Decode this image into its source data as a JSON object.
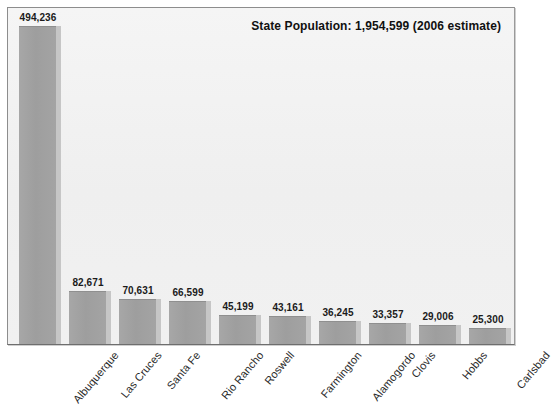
{
  "chart_data": {
    "type": "bar",
    "title": "State Population: 1,954,599 (2006 estimate)",
    "xlabel": "",
    "ylabel": "",
    "ylim": [
      0,
      494236
    ],
    "grid": false,
    "legend": null,
    "categories": [
      "Albuquerque",
      "Las Cruces",
      "Santa Fe",
      "Rio Rancho",
      "Roswell",
      "Farmington",
      "Alamogordo",
      "Clovis",
      "Hobbs",
      "Carlsbad"
    ],
    "values": [
      494236,
      82671,
      70631,
      66599,
      45199,
      43161,
      36245,
      33357,
      29006,
      25300
    ],
    "value_labels": [
      "494,236",
      "82,671",
      "70,631",
      "66,599",
      "45,199",
      "43,161",
      "36,245",
      "33,357",
      "29,006",
      "25,300"
    ],
    "colors": {
      "bar_fill": "#9e9e9e",
      "bar_shadow": "#c6c6c6",
      "plot_background": "#f1f1f1",
      "frame_border": "#8d8d8d",
      "text": "#1b1b1b"
    }
  }
}
